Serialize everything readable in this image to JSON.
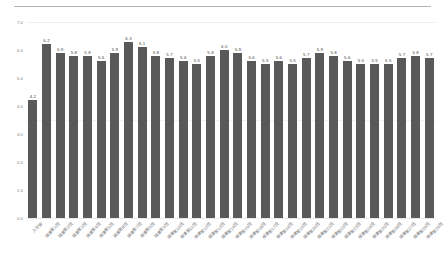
{
  "chart_data": {
    "type": "bar",
    "title": "",
    "xlabel": "",
    "ylabel": "",
    "ylim": [
      0.0,
      7.0
    ],
    "ytick_labels": [
      "0.0",
      "1.0",
      "2.0",
      "3.0",
      "4.0",
      "5.0",
      "6.0",
      "7.0"
    ],
    "ytick_values": [
      0.0,
      1.0,
      2.0,
      3.0,
      4.0,
      5.0,
      6.0,
      7.0
    ],
    "grid": "horizontal-faint",
    "legend": "none",
    "bar_color": "#595959",
    "categories": [
      "入学前",
      "授業第1回",
      "授業第2回",
      "授業第3回",
      "授業第4回",
      "授業第5回",
      "授業第6回",
      "授業第7回",
      "授業第8回",
      "授業第9回",
      "授業第10回",
      "授業第11回",
      "授業第12回",
      "授業第13回",
      "授業第14回",
      "授業第15回",
      "授業第16回",
      "授業第17回",
      "授業第18回",
      "授業第19回",
      "授業第20回",
      "授業第21回",
      "授業第22回",
      "授業第23回",
      "授業第24回",
      "授業第25回",
      "授業第26回",
      "授業第27回",
      "授業第28回",
      "授業第29回"
    ],
    "values": [
      4.2,
      6.2,
      5.9,
      5.8,
      5.8,
      5.6,
      5.9,
      6.3,
      6.1,
      5.8,
      5.7,
      5.6,
      5.5,
      5.8,
      6.0,
      5.9,
      5.6,
      5.5,
      5.6,
      5.5,
      5.7,
      5.9,
      5.8,
      5.6,
      5.5,
      5.5,
      5.5,
      5.7,
      5.8,
      5.7
    ],
    "value_labels": [
      "4.2",
      "6.2",
      "5.9",
      "5.8",
      "5.8",
      "5.6",
      "5.9",
      "6.3",
      "6.1",
      "5.8",
      "5.7",
      "5.6",
      "5.5",
      "5.8",
      "6.0",
      "5.9",
      "5.6",
      "5.5",
      "5.6",
      "5.5",
      "5.7",
      "5.9",
      "5.8",
      "5.6",
      "5.5",
      "5.5",
      "5.5",
      "5.7",
      "5.8",
      "5.7"
    ]
  }
}
